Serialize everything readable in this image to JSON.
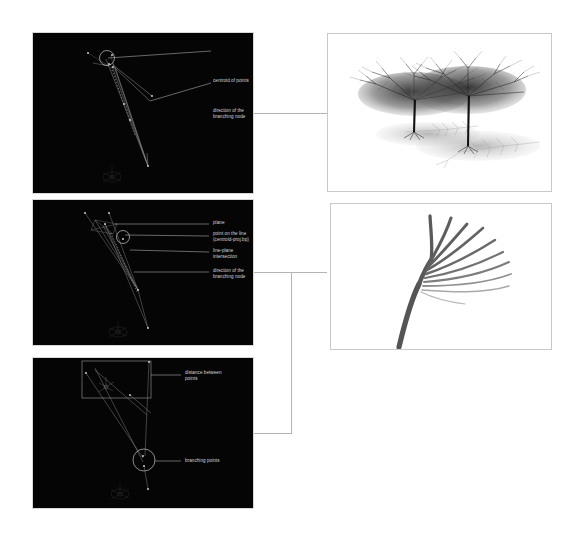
{
  "page": {
    "background": "#ffffff",
    "viewport_background": "#050505",
    "annotation_color": "#d6d6d6",
    "connector_color": "#b4b4b4",
    "panel_border_color": "#c9c9c9"
  },
  "panels": {
    "viewport_top": {
      "name": "centroid-and-direction-viewport",
      "annotations": [
        {
          "id": "centroid-of-points",
          "label": "centroid of points"
        },
        {
          "id": "direction-of-branching-node",
          "label": "direction of the\nbranching node"
        }
      ],
      "gizmo": "axis-gizmo"
    },
    "viewport_middle": {
      "name": "plane-intersection-viewport",
      "annotations": [
        {
          "id": "plane",
          "label": "plane"
        },
        {
          "id": "point-on-the-line",
          "label": "point on the line\n(centroid-proj.bp)"
        },
        {
          "id": "line-plane-intersection",
          "label": "line-plane intersection"
        },
        {
          "id": "direction-of-branching-node",
          "label": "direction of the\nbranching node"
        }
      ],
      "gizmo": "axis-gizmo"
    },
    "viewport_bottom": {
      "name": "branching-points-viewport",
      "annotations": [
        {
          "id": "distance-between-points",
          "label": "distance between\npoints"
        },
        {
          "id": "branching-points",
          "label": "branching points"
        }
      ],
      "gizmo": "axis-gizmo"
    },
    "image_top": {
      "name": "rendered-trees-image",
      "caption": "",
      "content": "two fractal trees with shadows"
    },
    "image_middle": {
      "name": "branch-fan-image",
      "caption": "",
      "content": "fan of branches diagram"
    }
  }
}
